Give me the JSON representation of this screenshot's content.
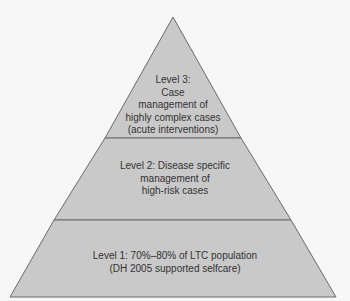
{
  "diagram": {
    "type": "pyramid",
    "colors": {
      "fill": "#c9c9c9",
      "stroke": "#6b6b6b",
      "text": "#333333",
      "background": "#f7f7f7"
    },
    "levels": [
      {
        "id": "level-3",
        "position": "top",
        "text": "Level 3:\nCase\nmanagement of\nhighly complex cases\n(acute interventions)"
      },
      {
        "id": "level-2",
        "position": "middle",
        "text": "Level 2: Disease specific\nmanagement of\nhigh-risk cases"
      },
      {
        "id": "level-1",
        "position": "bottom",
        "text": "Level 1: 70%–80% of LTC population\n(DH 2005 supported selfcare)"
      }
    ]
  }
}
